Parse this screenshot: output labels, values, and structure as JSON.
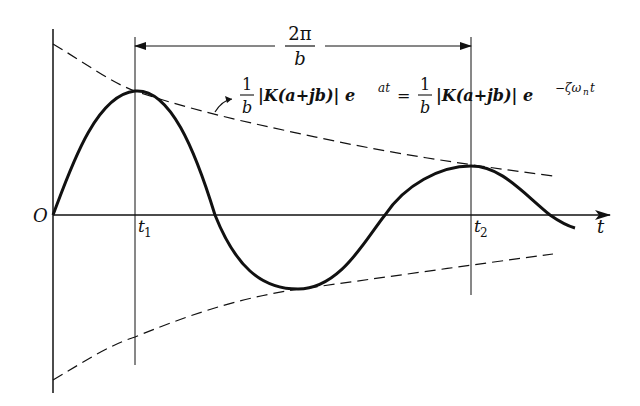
{
  "diagram": {
    "axes": {
      "origin_label": "O",
      "x_label": "t",
      "ticks": [
        {
          "label_main": "t",
          "label_sub": "1"
        },
        {
          "label_main": "t",
          "label_sub": "2"
        }
      ]
    },
    "period_annotation": {
      "numerator": "2π",
      "denominator": "b"
    },
    "envelope_annotation": {
      "frac1_num": "1",
      "frac1_den": "b",
      "part1": "|K(a+jb)| e",
      "exp1": "at",
      "equals": "=",
      "frac2_num": "1",
      "frac2_den": "b",
      "part2": "|K(a+jb)| e",
      "exp2": "−ζω",
      "exp2_sub": "n",
      "exp2_tail": "t"
    },
    "colors": {
      "ink": "#111111",
      "background": "#ffffff"
    }
  }
}
